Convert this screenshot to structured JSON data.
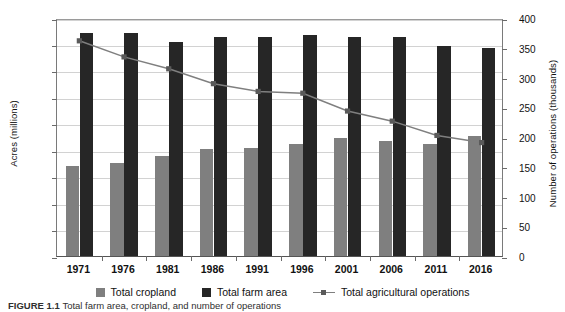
{
  "chart_data": {
    "type": "bar",
    "title": "",
    "subtitle": "",
    "xlabel": "",
    "ylabel": "Acres (millions)",
    "y2label": "Number of operations (thousands)",
    "categories": [
      "1971",
      "1976",
      "1981",
      "1986",
      "1991",
      "1996",
      "2001",
      "2006",
      "2011",
      "2016"
    ],
    "ylim": [
      0,
      180
    ],
    "y2lim": [
      0,
      400
    ],
    "yticks": [
      0,
      20,
      40,
      60,
      80,
      100,
      120,
      140,
      160,
      180
    ],
    "y2ticks": [
      0,
      50,
      100,
      150,
      200,
      250,
      300,
      350,
      400
    ],
    "grid": true,
    "legend_position": "bottom",
    "series": [
      {
        "name": "Total cropland",
        "kind": "bar",
        "axis": "left",
        "color": "#7f7f7f",
        "values": [
          68,
          70,
          76,
          81,
          82,
          85,
          89,
          87,
          85,
          91
        ]
      },
      {
        "name": "Total farm area",
        "kind": "bar",
        "axis": "left",
        "color": "#262626",
        "values": [
          169,
          169,
          162,
          166,
          166,
          167,
          166,
          166,
          159,
          157
        ]
      },
      {
        "name": "Total agricultural operations",
        "kind": "line",
        "axis": "right",
        "color": "#7f7f7f",
        "marker_color": "#5a5a5a",
        "values": [
          365,
          338,
          318,
          293,
          280,
          277,
          247,
          230,
          206,
          194
        ]
      }
    ]
  },
  "legend": {
    "items": [
      {
        "label": "Total cropland",
        "marker": "square-swatch",
        "color": "#7f7f7f"
      },
      {
        "label": "Total farm area",
        "marker": "square-swatch",
        "color": "#262626"
      },
      {
        "label": "Total agricultural operations",
        "marker": "line-swatch",
        "color": "#7f7f7f"
      }
    ]
  },
  "caption": {
    "label": "FIGURE 1.1",
    "text": "Total farm area, cropland, and number of operations"
  },
  "colors": {
    "cropland": "#7f7f7f",
    "farm_area": "#262626",
    "line": "#7f7f7f",
    "gridline": "#d2d2d2",
    "axis": "#6a6a6a"
  }
}
